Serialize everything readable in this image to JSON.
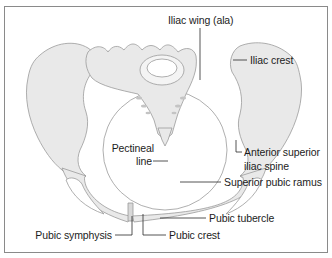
{
  "diagram": {
    "colors": {
      "frame": "#8a8a8a",
      "bone_fill": "#e9e9e9",
      "bone_outline": "#9a9a9a",
      "leader_line": "#2a2a2a",
      "text": "#1c1c1c",
      "background": "#ffffff"
    },
    "labels": {
      "iliac_wing": "Iliac wing (ala)",
      "iliac_crest": "Iliac crest",
      "asis_line1": "Anterior superior",
      "asis_line2": "iliac spine",
      "superior_pubic_ramus": "Superior pubic ramus",
      "pectineal_line1": "Pectineal",
      "pectineal_line2": "line",
      "pubic_tubercle": "Pubic tubercle",
      "pubic_crest": "Pubic crest",
      "pubic_symphysis": "Pubic symphysis"
    }
  }
}
